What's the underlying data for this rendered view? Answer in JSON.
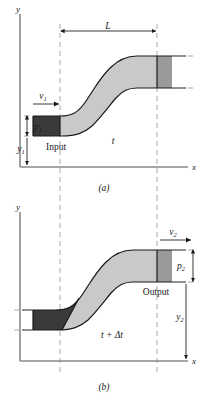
{
  "figure": {
    "panels": [
      {
        "id": "a",
        "caption": "(a)",
        "axis_y_label": "y",
        "axis_x_label": "x",
        "labels": {
          "velocity": "v",
          "velocity_sub": "1",
          "pressure": "p",
          "pressure_sub": "1",
          "height": "y",
          "height_sub": "1",
          "port": "Input",
          "time": "t",
          "length": "L"
        }
      },
      {
        "id": "b",
        "caption": "(b)",
        "axis_y_label": "y",
        "axis_x_label": "x",
        "labels": {
          "velocity": "v",
          "velocity_sub": "2",
          "pressure": "p",
          "pressure_sub": "2",
          "height": "y",
          "height_sub": "2",
          "port": "Output",
          "time": "t + Δt"
        }
      }
    ],
    "colors": {
      "fluid_light": "#c9c9c9",
      "fluid_mid": "#9a9a9a",
      "fluid_dark": "#3a3a3a",
      "axis": "#8a8a8a",
      "guide_dashed": "#b0a8a8",
      "outline": "#1a1a1a"
    }
  }
}
